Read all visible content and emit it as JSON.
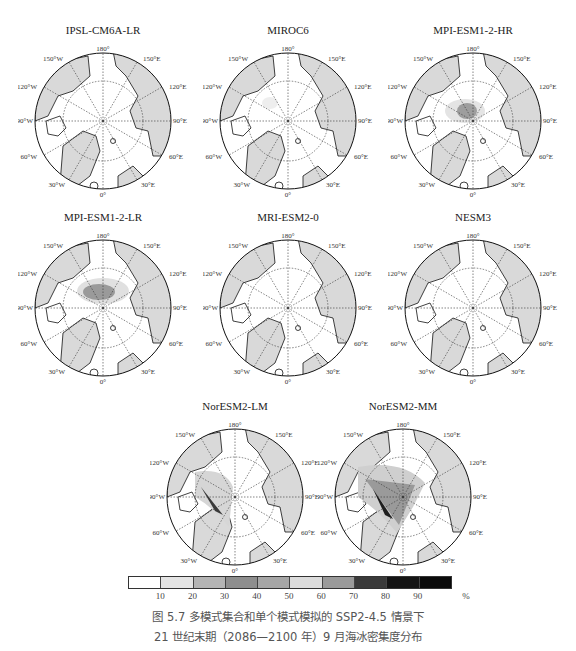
{
  "figure": {
    "caption_line1": "图 5.7   多模式集合和单个模式模拟的 SSP2-4.5 情景下",
    "caption_line2": "21 世纪末期（2086—2100 年）9 月海冰密集度分布"
  },
  "lon_labels": {
    "l180": "180°",
    "l150w": "150°W",
    "l150e": "150°E",
    "l120w": "120°W",
    "l120e": "120°E",
    "l90w": "90°W",
    "l90e": "90°E",
    "l60w": "60°W",
    "l60e": "60°E",
    "l30w": "30°W",
    "l30e": "30°E",
    "l0": "0°"
  },
  "panels": [
    {
      "title": "IPSL-CM6A-LR",
      "ice": "none"
    },
    {
      "title": "MIROC6",
      "ice": "trace"
    },
    {
      "title": "MPI-ESM1-2-HR",
      "ice": "central-small"
    },
    {
      "title": "MPI-ESM1-2-LR",
      "ice": "central-medium"
    },
    {
      "title": "MRI-ESM2-0",
      "ice": "none"
    },
    {
      "title": "NESM3",
      "ice": "none"
    },
    {
      "title": "NorESM2-LM",
      "ice": "canadian-archipelago-band"
    },
    {
      "title": "NorESM2-MM",
      "ice": "canadian-archipelago-wide"
    }
  ],
  "colorbar": {
    "colors": [
      "#ffffff",
      "#e4e4e4",
      "#b4b4b4",
      "#8e8e8e",
      "#a6a6a6",
      "#dcdcdc",
      "#9a9a9a",
      "#3a3a3a",
      "#141414",
      "#0a0a0a"
    ],
    "ticks": [
      "10",
      "20",
      "30",
      "40",
      "50",
      "60",
      "70",
      "80",
      "90",
      "%"
    ],
    "unit": "%"
  },
  "colors": {
    "land": "#d9d9d9",
    "ocean": "#ffffff",
    "coast": "#111111"
  }
}
